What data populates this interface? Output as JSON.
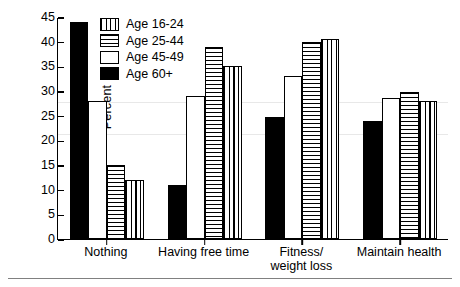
{
  "chart_data": {
    "type": "bar",
    "title": "",
    "xlabel": "",
    "ylabel": "Percent",
    "ylim": [
      0,
      45
    ],
    "ytick_step": 5,
    "yticks": [
      0,
      5,
      10,
      15,
      20,
      25,
      30,
      35,
      40,
      45
    ],
    "grid": false,
    "legend_position": "top-center-inside",
    "categories": [
      "Nothing",
      "Having free time",
      "Fitness/\nweight loss",
      "Maintain health"
    ],
    "bar_draw_order": [
      "Age 60+",
      "Age 45-49",
      "Age 25-44",
      "Age 16-24"
    ],
    "series": [
      {
        "name": "Age 16-24",
        "pattern": "vertical-lines",
        "values": [
          12,
          35,
          40.5,
          28
        ]
      },
      {
        "name": "Age 25-44",
        "pattern": "horizontal-lines",
        "values": [
          15,
          39,
          40,
          29.7
        ]
      },
      {
        "name": "Age 45-49",
        "pattern": "white",
        "values": [
          28,
          29,
          33,
          28.5
        ]
      },
      {
        "name": "Age 60+",
        "pattern": "black",
        "values": [
          44,
          11,
          24.8,
          24
        ]
      }
    ]
  },
  "legend": {
    "items": [
      {
        "label": "Age 16-24",
        "pattern": "vlines"
      },
      {
        "label": "Age 25-44",
        "pattern": "hlines"
      },
      {
        "label": "Age 45-49",
        "pattern": "empty"
      },
      {
        "label": "Age 60+",
        "pattern": "solid"
      }
    ]
  },
  "axes": {
    "y_label": "Percent",
    "y_ticks": [
      "45",
      "40",
      "35",
      "30",
      "25",
      "20",
      "15",
      "10",
      "5",
      "0"
    ],
    "x_ticks": [
      "Nothing",
      "Having free time",
      "Fitness/\nweight loss",
      "Maintain health"
    ]
  },
  "colors": {
    "ink": "#000000",
    "background": "#ffffff",
    "rule": "#808080",
    "faint_grid": "#e8e8e8"
  }
}
